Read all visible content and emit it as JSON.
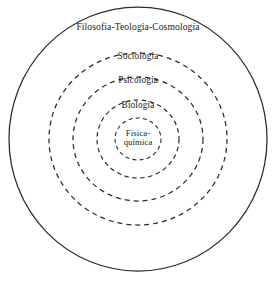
{
  "diagram": {
    "type": "concentric-circles",
    "title": "",
    "background_color": "#ffffff",
    "stroke_color": "#2b2b2b",
    "text_color": "#1a1a1a",
    "canvas": {
      "width": 278,
      "height": 282
    },
    "center": {
      "x": 138,
      "y": 139
    },
    "rings": [
      {
        "level": 0,
        "label": "Filosofia-Teologia-Cosmologia",
        "style": "solid",
        "radius_x": 129,
        "radius_y": 132,
        "label_x": 138,
        "label_y": 27
      },
      {
        "level": 1,
        "label": "Sociologia",
        "style": "dashed",
        "radius_x": 89,
        "radius_y": 86,
        "label_x": 138,
        "label_y": 56
      },
      {
        "level": 2,
        "label": "Psicologia",
        "style": "dashed",
        "radius_x": 65,
        "radius_y": 62,
        "label_x": 138,
        "label_y": 80
      },
      {
        "level": 3,
        "label": "Biologia",
        "style": "dashed",
        "radius_x": 41,
        "radius_y": 39,
        "label_x": 138,
        "label_y": 105
      },
      {
        "level": 4,
        "label": "Fisica-\nquímica",
        "style": "dashed",
        "radius_x": 23,
        "radius_y": 21,
        "label_x": 138,
        "label_y": 138
      }
    ]
  }
}
